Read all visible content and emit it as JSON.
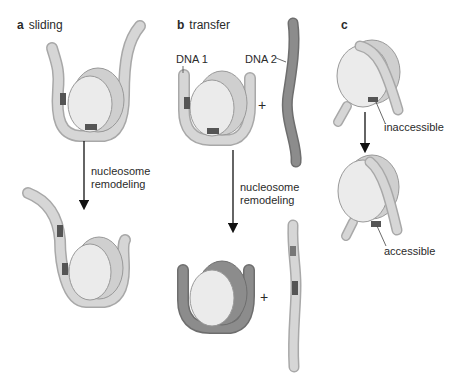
{
  "panels": {
    "a": {
      "letter": "a",
      "title": "sliding"
    },
    "b": {
      "letter": "b",
      "title": "transfer"
    },
    "c": {
      "letter": "c",
      "title": ""
    }
  },
  "labels": {
    "dna1": "DNA 1",
    "dna2": "DNA 2",
    "plus_top": "+",
    "plus_bottom": "+",
    "remodel_a_line1": "nucleosome",
    "remodel_a_line2": "remodeling",
    "remodel_b_line1": "nucleosome",
    "remodel_b_line2": "remodeling",
    "inaccessible": "inaccessible",
    "accessible": "accessible"
  },
  "colors": {
    "histone": "#e6e6e6",
    "dna_light": "#d0d0d0",
    "dna_dark": "#8a8a8a",
    "site": "#555555",
    "arrow": "#111111"
  }
}
